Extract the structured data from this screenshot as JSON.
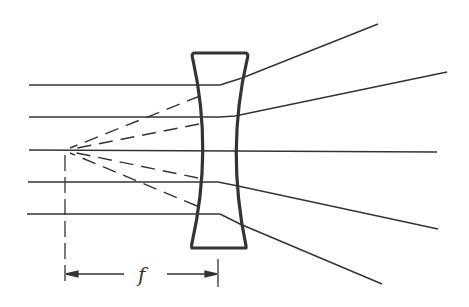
{
  "diagram": {
    "colors": {
      "ink": "#333333",
      "background": "#ffffff"
    },
    "lens": {
      "type": "biconcave",
      "top_y": 53,
      "bottom_y": 248,
      "top_left_x": 193,
      "top_right_x": 247,
      "bottom_left_x": 192,
      "bottom_right_x": 246,
      "center_left_x": 208,
      "center_right_x": 232
    },
    "focal_point": {
      "x": 65,
      "y": 150
    },
    "incoming_rays": [
      {
        "y": 85,
        "x_start": 29,
        "x_end": 220
      },
      {
        "y": 117,
        "x_start": 29,
        "x_end": 220
      },
      {
        "y": 150,
        "x_start": 29,
        "x_end": 437
      },
      {
        "y": 182,
        "x_start": 28,
        "x_end": 218
      },
      {
        "y": 214,
        "x_start": 27,
        "x_end": 220
      }
    ],
    "refracted_rays": [
      {
        "from": [
          220,
          85
        ],
        "bend": [
          242,
          78
        ],
        "to": [
          378,
          24
        ]
      },
      {
        "from": [
          220,
          117
        ],
        "bend": [
          235,
          116
        ],
        "to": [
          447,
          72
        ]
      },
      {
        "from": [
          218,
          182
        ],
        "bend": [
          238,
          186
        ],
        "to": [
          438,
          229
        ]
      },
      {
        "from": [
          220,
          214
        ],
        "bend": [
          240,
          224
        ],
        "to": [
          382,
          284
        ]
      }
    ],
    "virtual_rays": [
      {
        "from": [
          65,
          150
        ],
        "to": [
          200,
          96
        ]
      },
      {
        "from": [
          65,
          150
        ],
        "to": [
          199,
          124
        ]
      },
      {
        "from": [
          65,
          150
        ],
        "to": [
          198,
          178
        ]
      },
      {
        "from": [
          65,
          150
        ],
        "to": [
          197,
          206
        ]
      }
    ],
    "dimension": {
      "label": "f",
      "y": 274,
      "x_start": 65,
      "x_end": 218
    }
  }
}
